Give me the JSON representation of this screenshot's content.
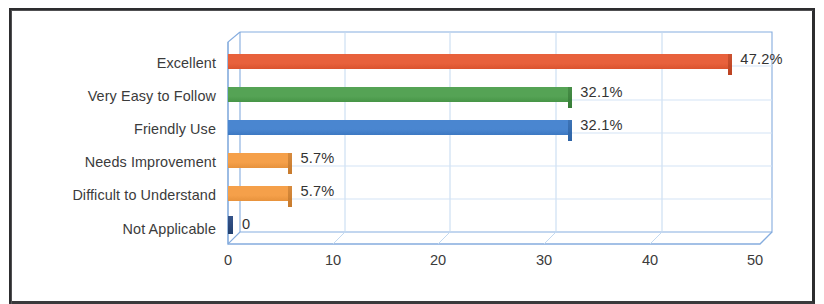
{
  "chart_data": {
    "type": "bar",
    "orientation": "horizontal",
    "style": "3d-clustered-bar",
    "title": "",
    "subtitle": "",
    "xlabel": "",
    "ylabel": "",
    "grid": true,
    "legend": false,
    "legend_position": "none",
    "xlim": [
      0,
      50
    ],
    "xticks": [
      "0",
      "10",
      "20",
      "30",
      "40",
      "50"
    ],
    "xtick_values": [
      0,
      10,
      20,
      30,
      40,
      50
    ],
    "categories": [
      "Excellent",
      "Very Easy to Follow",
      "Friendly Use",
      "Needs Improvement",
      "Difficult to Understand",
      "Not Applicable"
    ],
    "values": [
      47.2,
      32.1,
      32.1,
      5.7,
      5.7,
      0
    ],
    "data_labels": [
      "47.2%",
      "32.1%",
      "32.1%",
      "5.7%",
      "5.7%",
      "0"
    ],
    "colors": [
      "#E8613C",
      "#55A355",
      "#4A86D0",
      "#F5A04A",
      "#F5A04A",
      "#2E4E7E"
    ],
    "bar_top_color": "#8C817E",
    "wall_color": "#7EA8DC",
    "gridline_color": "#A8C6E8",
    "plot_background": "#FFFFFF",
    "label_color": "#3B3B3B"
  },
  "frame": {
    "border_color": "#2D2D2F"
  },
  "axis": {
    "tick_labels": [
      "0",
      "10",
      "20",
      "30",
      "40",
      "50"
    ]
  }
}
